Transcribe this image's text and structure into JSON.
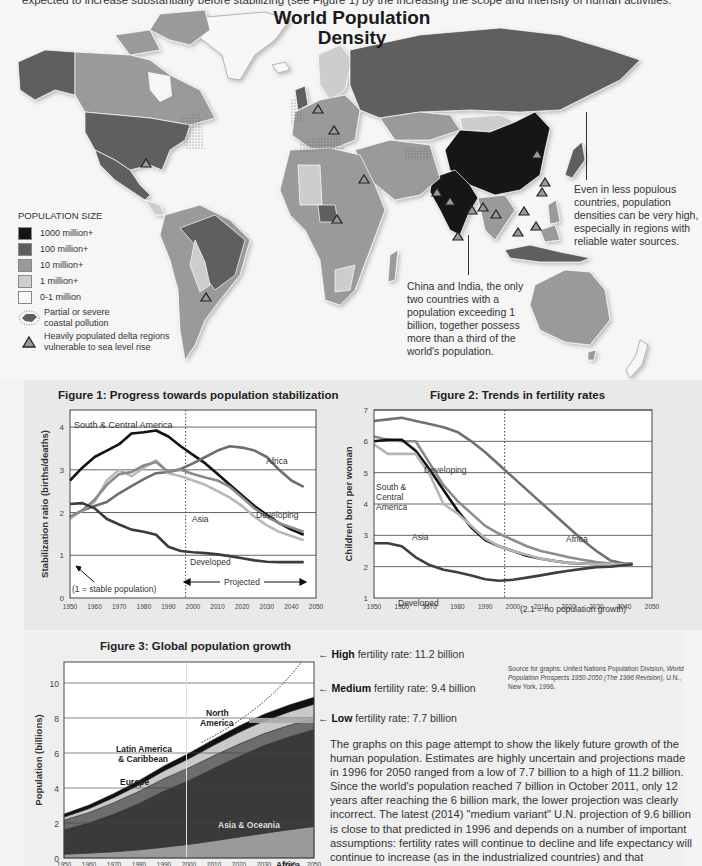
{
  "intro_text": "expected to increase substantially before stabilizing (see Figure 1) by the increasing the scope and intensity of human activities.",
  "map": {
    "title_line1": "World Population",
    "title_line2": "Density",
    "legend": {
      "title": "POPULATION SIZE",
      "items": [
        {
          "label": "1000 million+",
          "color": "#151515"
        },
        {
          "label": "100 million+",
          "color": "#5e5e5e"
        },
        {
          "label": "10 million+",
          "color": "#9a9a9a"
        },
        {
          "label": "1 million+",
          "color": "#cdcdcd"
        },
        {
          "label": "0-1 million",
          "color": "#f7f7f7"
        }
      ],
      "pollution_label_1": "Partial or severe",
      "pollution_label_2": "coastal pollution",
      "delta_label_1": "Heavily populated delta regions",
      "delta_label_2": "vulnerable to sea level rise"
    },
    "callout_east": "Even in less populous countries, population densities can be very high, especially in regions with reliable water sources.",
    "callout_china_india": "China and India, the only two countries with a population exceeding 1 billion, together possess more than a third of the world's population."
  },
  "chart_data": [
    {
      "type": "line",
      "title": "Figure 1: Progress towards population stabilization",
      "xlabel": "",
      "ylabel": "Stabilization ratio (births/deaths)",
      "xlim": [
        1950,
        2050
      ],
      "ylim": [
        0,
        4.4
      ],
      "xticks": [
        1950,
        1960,
        1970,
        1980,
        1990,
        2000,
        2010,
        2020,
        2030,
        2040,
        2050
      ],
      "yticks": [
        0,
        1,
        2,
        3,
        4
      ],
      "grid": "horizontal",
      "projection_start": 1997,
      "annotations": [
        "(1 = stable population)",
        "Projected"
      ],
      "x": [
        1950,
        1955,
        1960,
        1965,
        1970,
        1975,
        1980,
        1985,
        1990,
        1995,
        2000,
        2005,
        2010,
        2015,
        2020,
        2025,
        2030,
        2035,
        2040,
        2045
      ],
      "series": [
        {
          "name": "South & Central America",
          "color": "#111111",
          "values": [
            2.75,
            3.05,
            3.3,
            3.45,
            3.6,
            3.85,
            3.88,
            3.92,
            3.78,
            3.55,
            3.35,
            3.15,
            2.9,
            2.65,
            2.4,
            2.15,
            1.95,
            1.75,
            1.6,
            1.48
          ]
        },
        {
          "name": "Africa",
          "color": "#6e6e6e",
          "values": [
            1.9,
            2.05,
            2.15,
            2.25,
            2.45,
            2.62,
            2.78,
            2.92,
            2.95,
            3.02,
            3.15,
            3.3,
            3.45,
            3.55,
            3.52,
            3.45,
            3.3,
            3.0,
            2.75,
            2.6
          ]
        },
        {
          "name": "Asia",
          "color": "#b8b8b8",
          "values": [
            1.85,
            2.05,
            2.25,
            2.75,
            3.0,
            2.85,
            3.05,
            3.22,
            2.92,
            2.85,
            2.75,
            2.65,
            2.5,
            2.35,
            2.15,
            1.9,
            1.7,
            1.55,
            1.45,
            1.35
          ]
        },
        {
          "name": "Developing",
          "color": "#8a8a8a",
          "values": [
            1.9,
            2.05,
            2.3,
            2.65,
            2.9,
            2.95,
            3.1,
            3.18,
            2.95,
            3.0,
            2.9,
            2.82,
            2.75,
            2.6,
            2.35,
            2.1,
            1.9,
            1.75,
            1.65,
            1.55
          ]
        },
        {
          "name": "Developed",
          "color": "#3c3c3c",
          "values": [
            2.2,
            2.22,
            2.1,
            1.85,
            1.72,
            1.6,
            1.55,
            1.48,
            1.2,
            1.1,
            1.07,
            1.05,
            1.02,
            0.98,
            0.93,
            0.88,
            0.85,
            0.84,
            0.84,
            0.84
          ]
        }
      ]
    },
    {
      "type": "line",
      "title": "Figure 2: Trends in fertility rates",
      "xlabel": "",
      "ylabel": "Children born per woman",
      "xlim": [
        1950,
        2050
      ],
      "ylim": [
        1,
        7
      ],
      "xticks": [
        1950,
        1960,
        1970,
        1980,
        1990,
        2000,
        2010,
        2020,
        2030,
        2040,
        2050
      ],
      "yticks": [
        1,
        2,
        3,
        4,
        5,
        6,
        7
      ],
      "grid": "horizontal",
      "projection_start": 1997,
      "annotations": [
        "(2.1 = no population growth)"
      ],
      "x": [
        1950,
        1955,
        1960,
        1965,
        1970,
        1975,
        1980,
        1985,
        1990,
        1995,
        2000,
        2005,
        2010,
        2015,
        2020,
        2025,
        2030,
        2035,
        2040,
        2043
      ],
      "series": [
        {
          "name": "Africa",
          "color": "#707070",
          "values": [
            6.65,
            6.7,
            6.75,
            6.65,
            6.55,
            6.45,
            6.3,
            6.0,
            5.65,
            5.25,
            4.85,
            4.45,
            4.05,
            3.65,
            3.25,
            2.85,
            2.5,
            2.2,
            2.1,
            2.1
          ]
        },
        {
          "name": "Developing",
          "color": "#8c8c8c",
          "values": [
            6.15,
            6.05,
            6.0,
            6.0,
            5.3,
            4.6,
            4.1,
            3.7,
            3.3,
            3.05,
            2.85,
            2.65,
            2.5,
            2.4,
            2.3,
            2.22,
            2.15,
            2.1,
            2.08,
            2.08
          ]
        },
        {
          "name": "South & Central America",
          "color": "#111111",
          "values": [
            6.0,
            6.05,
            6.05,
            5.7,
            5.1,
            4.45,
            3.8,
            3.25,
            2.85,
            2.65,
            2.5,
            2.35,
            2.25,
            2.18,
            2.12,
            2.1,
            2.08,
            2.08,
            2.08,
            2.08
          ]
        },
        {
          "name": "Asia",
          "color": "#b5b5b5",
          "values": [
            5.9,
            5.6,
            5.6,
            5.6,
            4.95,
            4.0,
            3.7,
            3.3,
            2.9,
            2.65,
            2.5,
            2.38,
            2.25,
            2.18,
            2.12,
            2.1,
            2.08,
            2.08,
            2.08,
            2.08
          ]
        },
        {
          "name": "Developed",
          "color": "#3f3f3f",
          "values": [
            2.75,
            2.75,
            2.65,
            2.3,
            2.05,
            1.9,
            1.82,
            1.72,
            1.6,
            1.55,
            1.58,
            1.65,
            1.72,
            1.8,
            1.87,
            1.93,
            1.98,
            2.0,
            2.05,
            2.08
          ]
        }
      ]
    },
    {
      "type": "area",
      "title": "Figure 3:  Global population growth",
      "xlabel": "",
      "ylabel": "Population (billions)",
      "xlim": [
        1950,
        2050
      ],
      "ylim": [
        0,
        11.2
      ],
      "xticks": [
        1950,
        1960,
        1970,
        1980,
        1990,
        2000,
        2010,
        2020,
        2030,
        2040,
        2050
      ],
      "yticks": [
        0,
        2,
        4,
        6,
        8,
        10
      ],
      "grid": "horizontal",
      "stacked": true,
      "x": [
        1950,
        1960,
        1970,
        1980,
        1990,
        2000,
        2010,
        2020,
        2030,
        2040,
        2050
      ],
      "series": [
        {
          "name": "Africa",
          "color": "#9a9a9a",
          "values": [
            0.22,
            0.28,
            0.36,
            0.47,
            0.62,
            0.78,
            0.98,
            1.2,
            1.42,
            1.62,
            1.8
          ]
        },
        {
          "name": "Asia & Oceania",
          "color": "#3a3a3a",
          "values": [
            1.4,
            1.72,
            2.15,
            2.65,
            3.2,
            3.65,
            4.15,
            4.6,
            5.0,
            5.3,
            5.55
          ]
        },
        {
          "name": "Europe",
          "color": "#6d6d6d",
          "values": [
            0.55,
            0.6,
            0.66,
            0.69,
            0.72,
            0.73,
            0.72,
            0.71,
            0.69,
            0.66,
            0.63
          ]
        },
        {
          "name": "Latin America & Caribbean",
          "color": "#c9c9c9",
          "values": [
            0.17,
            0.22,
            0.29,
            0.36,
            0.44,
            0.52,
            0.6,
            0.67,
            0.72,
            0.77,
            0.81
          ]
        },
        {
          "name": "North America",
          "color": "#111111",
          "values": [
            0.17,
            0.2,
            0.23,
            0.25,
            0.28,
            0.31,
            0.34,
            0.36,
            0.38,
            0.39,
            0.4
          ]
        }
      ],
      "scenarios_2050": [
        {
          "name": "High fertility rate",
          "value": 11.2
        },
        {
          "name": "Medium fertility rate",
          "value": 9.4
        },
        {
          "name": "Low fertility rate",
          "value": 7.7
        }
      ],
      "annotations": [
        "North America",
        "Latin America & Caribbean",
        "Europe",
        "Asia & Oceania",
        "Africa"
      ]
    }
  ],
  "figure3_side": {
    "high_bold": "High",
    "high_rest": " fertility rate: 11.2 billion",
    "medium_bold": "Medium",
    "medium_rest": " fertility rate: 9.4 billion",
    "low_bold": "Low",
    "low_rest": " fertility rate: 7.7 billion"
  },
  "source": {
    "line1": "Source for graphs: United Nations Population Division,",
    "title": "World Population Prospects 1950-2050 (The 1996 Revision)",
    "line3": ", U.N., New York, 1996."
  },
  "paragraph": "The graphs on this page attempt to show the likely future growth of the human population. Estimates are highly uncertain and projections made in 1996 for 2050 ranged from a low of 7.7 billion to a high of 11.2 billion. Since the world's population reached 7 billion in October 2011, only 12 years after reaching the 6 billion mark, the lower projection was clearly incorrect. The latest (2014) \"medium variant\" U.N. projection of 9.6 billion is close to that predicted in 1996 and depends on a number of important assumptions: fertility rates will continue to decline and life expectancy will continue to increase (as in the industrialized countries) and that developing countries will broadly follow these demographic trends."
}
